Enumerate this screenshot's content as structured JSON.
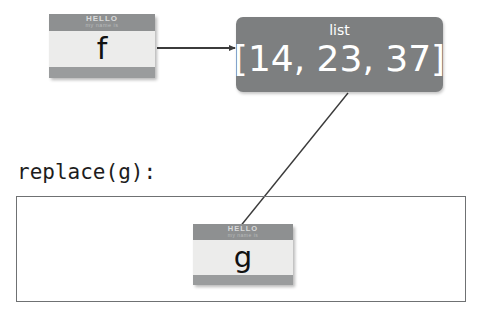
{
  "diagram": {
    "nametags": [
      {
        "id": "tag-f",
        "hello": "HELLO",
        "subtitle": "my name is",
        "letter": "f"
      },
      {
        "id": "tag-g",
        "hello": "HELLO",
        "subtitle": "my name is",
        "letter": "g"
      }
    ],
    "object_box": {
      "type_label": "list",
      "value": "[14, 23, 37]"
    },
    "scope": {
      "label": "replace(g):"
    },
    "connectors": [
      {
        "name": "f-to-list",
        "from": "tag-f",
        "to": "object_box",
        "style": "arrow"
      },
      {
        "name": "g-to-list",
        "from": "tag-g",
        "to": "object_box",
        "style": "line"
      }
    ],
    "colors": {
      "tag_header": "#8e9091",
      "tag_body": "#ececeb",
      "tag_footer": "#9a9c9d",
      "object_box": "#7d7f80",
      "object_text": "#ffffff",
      "frame_border": "#6f7173",
      "connector": "#3b3b3b",
      "background": "#ffffff"
    }
  }
}
